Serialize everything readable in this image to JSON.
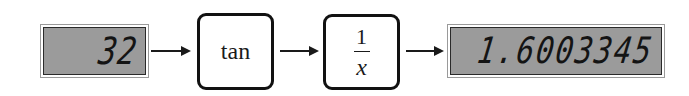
{
  "diagram": {
    "input_display": {
      "value": "32"
    },
    "keys": [
      {
        "label": "tan"
      },
      {
        "numerator": "1",
        "denominator": "x"
      }
    ],
    "output_display": {
      "value": "1.6003345"
    },
    "arrows": 3
  },
  "colors": {
    "display_bg": "#9b9b9b",
    "digit": "#141414",
    "key_border": "#111111"
  }
}
